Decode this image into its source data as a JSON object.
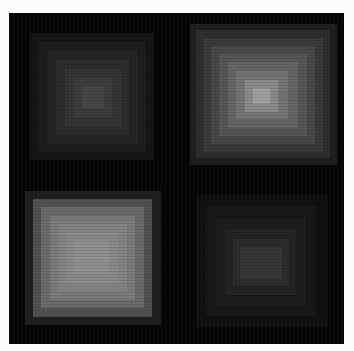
{
  "image": {
    "width": 354,
    "height": 351,
    "background": "#fbfbfb",
    "panel": {
      "x": 9,
      "y": 13,
      "width": 335,
      "height": 331,
      "color": "#050505"
    }
  },
  "patterns": [
    {
      "name": "top-left-concentric-squares",
      "center": [
        92,
        96
      ],
      "rings": [
        {
          "x": 30,
          "y": 33,
          "w": 124,
          "h": 127,
          "color": "#141414"
        },
        {
          "x": 38,
          "y": 42,
          "w": 108,
          "h": 110,
          "color": "#1c1c1c"
        },
        {
          "x": 47,
          "y": 51,
          "w": 91,
          "h": 93,
          "color": "#232323"
        },
        {
          "x": 56,
          "y": 60,
          "w": 73,
          "h": 75,
          "color": "#2b2b2b"
        },
        {
          "x": 65,
          "y": 69,
          "w": 56,
          "h": 57,
          "color": "#333333"
        },
        {
          "x": 74,
          "y": 78,
          "w": 38,
          "h": 39,
          "color": "#3b3b3b"
        },
        {
          "x": 82,
          "y": 86,
          "w": 22,
          "h": 22,
          "color": "#454545"
        }
      ]
    },
    {
      "name": "top-right-concentric-squares",
      "center": [
        260,
        95
      ],
      "rings": [
        {
          "x": 190,
          "y": 24,
          "w": 147,
          "h": 141,
          "color": "#1e1e1e"
        },
        {
          "x": 196,
          "y": 30,
          "w": 134,
          "h": 128,
          "color": "#2c2c2c"
        },
        {
          "x": 203,
          "y": 38,
          "w": 120,
          "h": 114,
          "color": "#383838"
        },
        {
          "x": 211,
          "y": 46,
          "w": 104,
          "h": 98,
          "color": "#464646"
        },
        {
          "x": 219,
          "y": 54,
          "w": 88,
          "h": 82,
          "color": "#555555"
        },
        {
          "x": 228,
          "y": 62,
          "w": 70,
          "h": 66,
          "color": "#646464"
        },
        {
          "x": 236,
          "y": 71,
          "w": 52,
          "h": 48,
          "color": "#747474"
        },
        {
          "x": 245,
          "y": 80,
          "w": 33,
          "h": 32,
          "color": "#8a8a8a"
        },
        {
          "x": 253,
          "y": 88,
          "w": 17,
          "h": 16,
          "color": "#a0a0a0"
        }
      ]
    },
    {
      "name": "bottom-left-concentric-squares",
      "center": [
        90,
        258
      ],
      "rings": [
        {
          "x": 25,
          "y": 191,
          "w": 136,
          "h": 134,
          "color": "#1e1e1e"
        },
        {
          "x": 33,
          "y": 199,
          "w": 119,
          "h": 118,
          "color": "#505050"
        },
        {
          "x": 41,
          "y": 207,
          "w": 103,
          "h": 101,
          "color": "#6a6a6a"
        },
        {
          "x": 50,
          "y": 216,
          "w": 85,
          "h": 84,
          "color": "#7a7a7a"
        },
        {
          "x": 58,
          "y": 224,
          "w": 69,
          "h": 67,
          "color": "#838383"
        },
        {
          "x": 66,
          "y": 232,
          "w": 52,
          "h": 51,
          "color": "#898989"
        },
        {
          "x": 74,
          "y": 240,
          "w": 35,
          "h": 34,
          "color": "#8f8f8f"
        }
      ]
    },
    {
      "name": "bottom-right-concentric-squares",
      "center": [
        260,
        262
      ],
      "rings": [
        {
          "x": 196,
          "y": 195,
          "w": 132,
          "h": 132,
          "color": "#0f0f0f"
        },
        {
          "x": 206,
          "y": 206,
          "w": 110,
          "h": 110,
          "color": "#161616"
        },
        {
          "x": 216,
          "y": 218,
          "w": 90,
          "h": 88,
          "color": "#1c1c1c"
        },
        {
          "x": 226,
          "y": 229,
          "w": 70,
          "h": 66,
          "color": "#222222"
        },
        {
          "x": 233,
          "y": 239,
          "w": 56,
          "h": 46,
          "color": "#2a2a2a"
        },
        {
          "x": 240,
          "y": 247,
          "w": 42,
          "h": 32,
          "color": "#353535"
        }
      ]
    }
  ]
}
